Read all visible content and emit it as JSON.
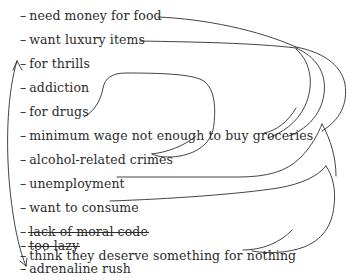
{
  "canvas": {
    "width": 349,
    "height": 280,
    "background": "#ffffff",
    "ink": "#2b2b2b",
    "stroke": "#2e2e2e"
  },
  "list": {
    "bullet": "–",
    "items": [
      {
        "label": "need money for food",
        "struck": false,
        "y": 8,
        "connector": true,
        "icon": "connector-line-icon"
      },
      {
        "label": "want luxury items",
        "struck": false,
        "y": 32,
        "connector": true,
        "icon": "connector-line-icon"
      },
      {
        "label": "for thrills",
        "struck": false,
        "y": 56,
        "connector": true,
        "icon": "arrow-target-icon"
      },
      {
        "label": "addiction",
        "struck": false,
        "y": 80,
        "connector": true,
        "icon": "connector-loop-icon"
      },
      {
        "label": "for drugs",
        "struck": false,
        "y": 104,
        "connector": true,
        "icon": "connector-loop-icon"
      },
      {
        "label": "minimum wage not enough to buy groceries",
        "struck": false,
        "y": 128,
        "connector": true,
        "icon": "connector-line-icon"
      },
      {
        "label": "alcohol-related crimes",
        "struck": false,
        "y": 152,
        "connector": true,
        "icon": "connector-loop-icon"
      },
      {
        "label": "unemployment",
        "struck": false,
        "y": 176,
        "connector": true,
        "icon": "connector-line-icon"
      },
      {
        "label": "want to consume",
        "struck": false,
        "y": 200,
        "connector": true,
        "icon": "connector-line-icon"
      },
      {
        "label": "lack of moral code",
        "struck": true,
        "y": 224,
        "connector": false,
        "icon": "strikethrough-icon"
      },
      {
        "label": "think they deserve something for nothing",
        "struck": false,
        "y": 248,
        "connector": true,
        "icon": "connector-line-icon"
      },
      {
        "label": "too lazy",
        "struck": true,
        "y": 272,
        "connector": false,
        "icon": "strikethrough-icon"
      },
      {
        "label": "adrenaline rush",
        "struck": false,
        "y": 296,
        "connector": true,
        "icon": "arrow-target-icon"
      }
    ]
  },
  "annotations": {
    "left_double_arrow": {
      "name": "thrills-to-adrenaline-arrow",
      "from_item": "for thrills",
      "to_item": "adrenaline rush",
      "double_headed": true
    },
    "right_cluster_node": {
      "name": "right-convergence-node",
      "x": 296,
      "y": 48
    }
  }
}
